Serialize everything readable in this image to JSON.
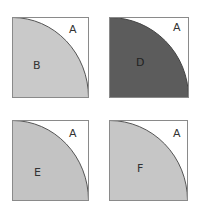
{
  "panels": [
    {
      "id": "B",
      "corner_label": "A",
      "region_label": "B",
      "fill": "#c9c9c9",
      "x": 12,
      "y": 17,
      "w": 76,
      "h": 80
    },
    {
      "id": "D",
      "corner_label": "A",
      "region_label": "D",
      "fill": "#5c5c5c",
      "x": 109,
      "y": 17,
      "w": 79,
      "h": 80
    },
    {
      "id": "E",
      "corner_label": "A",
      "region_label": "E",
      "fill": "#c3c3c3",
      "x": 12,
      "y": 120,
      "w": 76,
      "h": 80
    },
    {
      "id": "F",
      "corner_label": "A",
      "region_label": "F",
      "fill": "#c6c6c6",
      "x": 109,
      "y": 120,
      "w": 78,
      "h": 80
    }
  ],
  "colors": {
    "border": "#8a8a8a",
    "arc": "#555555",
    "background": "#ffffff"
  }
}
